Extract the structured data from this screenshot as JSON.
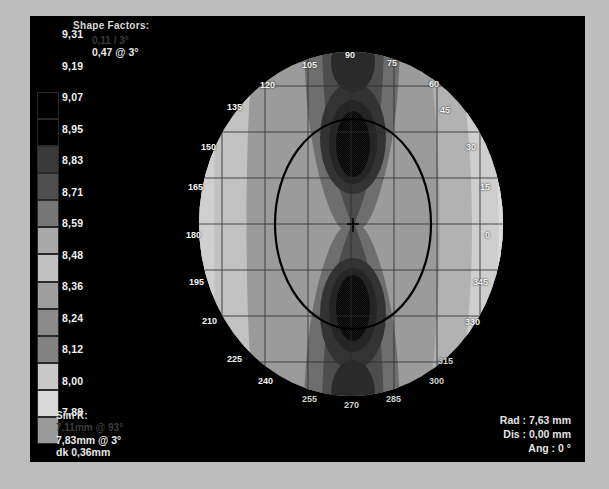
{
  "window": {
    "background_color": "#bdbdbd",
    "canvas_color": "#000000"
  },
  "header": {
    "title": "Shape Factors:",
    "line1": "0,11 / 3°",
    "line2": "0,47 @ 3°"
  },
  "footer_left": {
    "title": "Sim K:",
    "line1": "7,11mm @ 93°",
    "line2": "7,83mm @ 3°",
    "line3": "dk 0,36mm"
  },
  "readout": {
    "rad_label": "Rad :",
    "rad_value": "7,63 mm",
    "dis_label": "Dis :",
    "dis_value": "0,00 mm",
    "ang_label": "Ang :",
    "ang_value": "0 °",
    "rad_line": "Rad : 7,63 mm",
    "dis_line": "Dis : 0,00 mm",
    "ang_line": "Ang : 0 °"
  },
  "chart_data": {
    "type": "heatmap",
    "title": "Shape Factors:",
    "subtitle": "Corneal topography axial curvature map (mm)",
    "units": "mm",
    "colorbar": {
      "orientation": "vertical",
      "labels": [
        "9,31",
        "9,19",
        "9,07",
        "8,95",
        "8,83",
        "8,71",
        "8,59",
        "8,48",
        "8,36",
        "8,24",
        "8,12",
        "8,00",
        "7,88"
      ],
      "values": [
        9.31,
        9.19,
        9.07,
        8.95,
        8.83,
        8.71,
        8.59,
        8.48,
        8.36,
        8.24,
        8.12,
        8.0,
        7.88
      ],
      "colors": [
        "#000000",
        "#000000",
        "#3a3a3a",
        "#4e4e4e",
        "#767676",
        "#a9a9a9",
        "#c0c0c0",
        "#9e9e9e",
        "#8a8a8a",
        "#828282",
        "#c8c8c8",
        "#d8d8d8",
        "#9a9a9a"
      ],
      "min": 7.88,
      "max": 9.31,
      "step": 0.12
    },
    "angle_labels": {
      "top": [
        "120",
        "105",
        "90",
        "75",
        "60"
      ],
      "right": [
        "45",
        "30",
        "15",
        "0",
        "345",
        "330",
        "315"
      ],
      "bottom": [
        "240",
        "255",
        "270",
        "285",
        "300"
      ],
      "left": [
        "135",
        "150",
        "165",
        "180",
        "195",
        "210",
        "225"
      ]
    },
    "grid": true,
    "pattern": "symmetric bowtie (with-the-rule astigmatism)",
    "center_marker": "crosshair",
    "pupil_ring": "ellipse outline",
    "sim_k_steep": 7.11,
    "sim_k_steep_axis": 93,
    "sim_k_flat": 7.83,
    "sim_k_flat_axis": 3,
    "dk": 0.36,
    "cursor_rad": 7.63,
    "cursor_dis": 0.0,
    "cursor_ang": 0
  }
}
